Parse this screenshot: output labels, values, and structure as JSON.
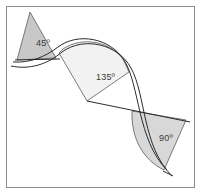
{
  "figure": {
    "background_color": "#ffffff",
    "frame_border_color": "#8d8d8d",
    "curve_stroke_color": "#2b2b2b",
    "label_text_color": "#3a3a3a"
  },
  "shapes": [
    {
      "id": "wedge-45",
      "label": "45º",
      "angle_value": 45,
      "fill_color": "#c8c8c8",
      "edge_color": "#5a5a5a",
      "label_x": 36,
      "label_y": 46,
      "apex": [
        30,
        12
      ],
      "path": "M 30 12 L 56 58 L 17 60 Z"
    },
    {
      "id": "wedge-135",
      "label": "135º",
      "angle_value": 135,
      "fill_color": "#f2f2f2",
      "edge_color": "#5a5a5a",
      "label_x": 96,
      "label_y": 80,
      "apex": [
        87,
        101
      ],
      "path": "M 87 101 L 59 53 L 63 49 C 82 36 112 41 124 61 L 129 72 Z"
    },
    {
      "id": "wedge-90",
      "label": "90º",
      "angle_value": 90,
      "fill_color": "#d8d8d8",
      "edge_color": "#5a5a5a",
      "label_x": 159,
      "label_y": 141,
      "apex": [
        186,
        120
      ],
      "path": "M 186 120 L 132 111 C 131 138 143 160 164 170 L 186 120 Z"
    }
  ],
  "curves": [
    {
      "id": "s-curve-outer",
      "description": "upper offset S-curve",
      "path": "M 13 62 C 30 63 45 57 58 47 C 78 32 110 38 124 60 C 140 85 137 140 167 170"
    },
    {
      "id": "s-curve-inner",
      "description": "lower offset S-curve",
      "path": "M 11 66 C 30 70 48 64 62 52 C 84 36 118 44 131 68 C 146 95 142 146 172 176"
    }
  ],
  "connector_lines": [
    {
      "id": "connector-45-lower",
      "path": "M 15 60 L 60 59"
    },
    {
      "id": "connector-135-axis",
      "path": "M 87 101 L 190 122"
    },
    {
      "id": "connector-90-chord",
      "path": "M 163 171 L 173 176"
    }
  ],
  "labels": {
    "wedge_45": "45º",
    "wedge_135": "135º",
    "wedge_90": "90º"
  }
}
